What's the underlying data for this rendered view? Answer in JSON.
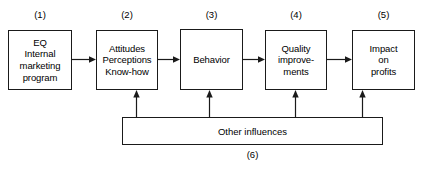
{
  "diagram": {
    "stroke_color": "#1a1a1a",
    "background_color": "#ffffff",
    "boxes": [
      {
        "id": "eq-internal-marketing-program",
        "number": "(1)",
        "lines": [
          "EQ",
          "Internal",
          "marketing",
          "program"
        ]
      },
      {
        "id": "attitudes-perceptions-knowhow",
        "number": "(2)",
        "lines": [
          "Attitudes",
          "Perceptions",
          "Know-how"
        ]
      },
      {
        "id": "behavior",
        "number": "(3)",
        "lines": [
          "Behavior"
        ]
      },
      {
        "id": "quality-improvements",
        "number": "(4)",
        "lines": [
          "Quality",
          "improve-",
          "ments"
        ]
      },
      {
        "id": "impact-on-profits",
        "number": "(5)",
        "lines": [
          "Impact",
          "on",
          "profits"
        ]
      }
    ],
    "bottom_bar": {
      "id": "other-influences",
      "label": "Other influences",
      "number": "(6)"
    }
  }
}
